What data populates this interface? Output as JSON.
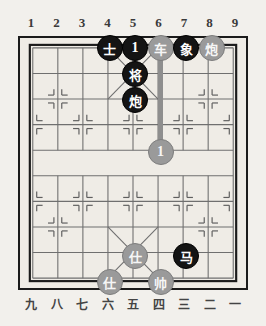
{
  "app": {
    "title": "Xiangqi Board Position"
  },
  "board": {
    "files": 9,
    "ranks": 10,
    "top_labels": [
      "1",
      "2",
      "3",
      "4",
      "5",
      "6",
      "7",
      "8",
      "9"
    ],
    "bottom_labels": [
      "九",
      "八",
      "七",
      "六",
      "五",
      "四",
      "三",
      "二",
      "一"
    ],
    "colors": {
      "background": "#f2f0ec",
      "board_fill": "#efece6",
      "line": "#6f6f6f",
      "border": "#1b1b1b",
      "black_piece": "#141414",
      "gray_piece": "#9a9a9a",
      "arrow": "#8e8e8e"
    },
    "river_label": ""
  },
  "pieces": [
    {
      "id": "p1",
      "label": "士",
      "side": "black",
      "file": 4,
      "rank": 0,
      "name": "advisor"
    },
    {
      "id": "p2",
      "label": "1",
      "side": "black",
      "file": 5,
      "rank": 0,
      "name": "marker-one"
    },
    {
      "id": "p3",
      "label": "车",
      "side": "gray",
      "file": 6,
      "rank": 0,
      "name": "chariot"
    },
    {
      "id": "p4",
      "label": "象",
      "side": "black",
      "file": 7,
      "rank": 0,
      "name": "elephant"
    },
    {
      "id": "p5",
      "label": "炮",
      "side": "gray",
      "file": 8,
      "rank": 0,
      "name": "cannon"
    },
    {
      "id": "p6",
      "label": "将",
      "side": "black",
      "file": 5,
      "rank": 1,
      "name": "general"
    },
    {
      "id": "p7",
      "label": "炮",
      "side": "black",
      "file": 5,
      "rank": 2,
      "name": "cannon"
    },
    {
      "id": "p8",
      "label": "1",
      "side": "gray",
      "file": 6,
      "rank": 4,
      "name": "marker-one"
    },
    {
      "id": "p9",
      "label": "仕",
      "side": "gray",
      "file": 5,
      "rank": 8,
      "name": "advisor"
    },
    {
      "id": "p10",
      "label": "马",
      "side": "black",
      "file": 7,
      "rank": 8,
      "name": "horse"
    },
    {
      "id": "p11",
      "label": "仕",
      "side": "gray",
      "file": 4,
      "rank": 9,
      "name": "advisor"
    },
    {
      "id": "p12",
      "label": "帅",
      "side": "gray",
      "file": 6,
      "rank": 9,
      "name": "marshal"
    }
  ],
  "arrows": [
    {
      "id": "a1",
      "name": "move-arrow-short",
      "from_file": 5,
      "from_rank": 0,
      "to_file": 5,
      "to_rank": 1
    },
    {
      "id": "a2",
      "name": "move-arrow-long",
      "from_file": 6,
      "from_rank": 4,
      "to_file": 6,
      "to_rank": 0
    }
  ]
}
